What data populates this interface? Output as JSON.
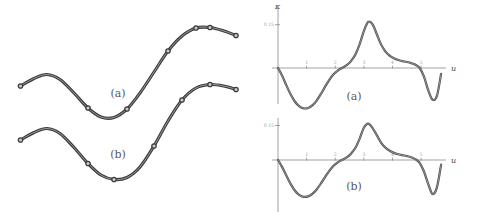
{
  "figure": {
    "background_color": "#ffffff",
    "ink_color": "#3c3c3c",
    "axis_color": "#8c8c8c",
    "marker_fill": "#c9c9c9",
    "caption_color": "#5a5a5a"
  },
  "left": {
    "caption_a": "(a)",
    "caption_b": "(b)",
    "curve_a": {
      "name": "curve-a",
      "points": [
        [
          20.5,
          86.0
        ],
        [
          34.0,
          78.5
        ],
        [
          47.0,
          74.5
        ],
        [
          60.0,
          79.5
        ],
        [
          74.0,
          93.0
        ],
        [
          88.0,
          108.0
        ],
        [
          101.0,
          117.0
        ],
        [
          114.0,
          117.5
        ],
        [
          127.0,
          109.0
        ],
        [
          140.0,
          93.0
        ],
        [
          154.0,
          72.0
        ],
        [
          168.0,
          51.0
        ],
        [
          182.0,
          36.0
        ],
        [
          196.0,
          28.0
        ],
        [
          210.0,
          27.5
        ],
        [
          224.0,
          31.0
        ],
        [
          236.0,
          35.5
        ]
      ],
      "marker_points": [
        [
          20.5,
          86.0
        ],
        [
          88.0,
          108.0
        ],
        [
          127.0,
          109.0
        ],
        [
          168.0,
          51.0
        ],
        [
          196.0,
          28.0
        ],
        [
          210.0,
          27.5
        ],
        [
          236.0,
          35.5
        ]
      ]
    },
    "curve_b": {
      "name": "curve-b",
      "points": [
        [
          20.5,
          140.0
        ],
        [
          34.0,
          132.5
        ],
        [
          47.0,
          128.5
        ],
        [
          60.0,
          133.5
        ],
        [
          74.0,
          147.5
        ],
        [
          88.0,
          163.5
        ],
        [
          101.0,
          175.0
        ],
        [
          114.0,
          179.5
        ],
        [
          127.0,
          177.5
        ],
        [
          140.0,
          167.0
        ],
        [
          154.0,
          146.0
        ],
        [
          168.0,
          121.0
        ],
        [
          182.0,
          100.0
        ],
        [
          196.0,
          88.0
        ],
        [
          210.0,
          84.5
        ],
        [
          224.0,
          86.0
        ],
        [
          236.0,
          89.5
        ]
      ],
      "marker_points": [
        [
          20.5,
          140.0
        ],
        [
          88.0,
          163.5
        ],
        [
          114.0,
          179.5
        ],
        [
          154.0,
          146.0
        ],
        [
          182.0,
          100.0
        ],
        [
          210.0,
          84.5
        ],
        [
          236.0,
          89.5
        ]
      ]
    }
  },
  "right": {
    "caption_a": "(a)",
    "caption_b": "(b)",
    "yaxis_name": "κ",
    "xaxis_name": "u",
    "ytick_label": "0.15",
    "xtick_labels": [
      "1",
      "2",
      "3",
      "4",
      "5"
    ]
  },
  "chart_data": [
    {
      "type": "line",
      "name": "curvature-plot-a",
      "title": "(a)",
      "xlabel": "u",
      "ylabel": "κ",
      "xlim": [
        0,
        5.8
      ],
      "ylim": [
        -0.16,
        0.175
      ],
      "xticks": [
        1,
        2,
        3,
        4,
        5
      ],
      "xticklabels": [
        "1",
        "2",
        "3",
        "4",
        "5"
      ],
      "yticks": [
        0.15
      ],
      "yticklabels": [
        "0.15"
      ],
      "grid": false,
      "legend": false,
      "x": [
        0.0,
        0.15,
        0.3,
        0.45,
        0.6,
        0.75,
        0.9,
        1.05,
        1.2,
        1.35,
        1.5,
        1.65,
        1.8,
        1.95,
        2.1,
        2.25,
        2.4,
        2.55,
        2.7,
        2.85,
        3.0,
        3.15,
        3.3,
        3.45,
        3.6,
        3.75,
        3.9,
        4.05,
        4.2,
        4.35,
        4.5,
        4.65,
        4.8,
        4.95,
        5.1,
        5.25,
        5.4,
        5.55,
        5.7
      ],
      "y": [
        0.0,
        -0.028,
        -0.062,
        -0.093,
        -0.118,
        -0.133,
        -0.14,
        -0.139,
        -0.13,
        -0.113,
        -0.09,
        -0.064,
        -0.04,
        -0.021,
        -0.008,
        0.001,
        0.01,
        0.024,
        0.046,
        0.082,
        0.128,
        0.16,
        0.152,
        0.118,
        0.082,
        0.058,
        0.043,
        0.034,
        0.028,
        0.024,
        0.021,
        0.017,
        0.011,
        0.0,
        -0.03,
        -0.078,
        -0.11,
        -0.098,
        -0.02
      ]
    },
    {
      "type": "line",
      "name": "curvature-plot-b",
      "title": "(b)",
      "xlabel": "u",
      "ylabel": "κ",
      "xlim": [
        0,
        5.8
      ],
      "ylim": [
        -0.185,
        0.175
      ],
      "xticks": [
        1,
        2,
        3,
        4,
        5
      ],
      "xticklabels": [
        "1",
        "2",
        "3",
        "4",
        "5"
      ],
      "yticks": [
        0.15
      ],
      "yticklabels": [
        "0.15"
      ],
      "grid": false,
      "legend": false,
      "x": [
        0.0,
        0.15,
        0.3,
        0.45,
        0.6,
        0.75,
        0.9,
        1.05,
        1.2,
        1.35,
        1.5,
        1.65,
        1.8,
        1.95,
        2.1,
        2.25,
        2.4,
        2.55,
        2.7,
        2.85,
        3.0,
        3.15,
        3.3,
        3.45,
        3.6,
        3.75,
        3.9,
        4.05,
        4.2,
        4.35,
        4.5,
        4.65,
        4.8,
        4.95,
        5.1,
        5.25,
        5.4,
        5.55,
        5.7
      ],
      "y": [
        0.0,
        -0.032,
        -0.07,
        -0.106,
        -0.135,
        -0.153,
        -0.16,
        -0.158,
        -0.147,
        -0.128,
        -0.102,
        -0.073,
        -0.046,
        -0.024,
        -0.009,
        0.001,
        0.011,
        0.027,
        0.052,
        0.092,
        0.14,
        0.158,
        0.14,
        0.108,
        0.076,
        0.054,
        0.04,
        0.031,
        0.025,
        0.021,
        0.017,
        0.012,
        0.004,
        -0.012,
        -0.05,
        -0.105,
        -0.148,
        -0.12,
        -0.02
      ]
    }
  ]
}
